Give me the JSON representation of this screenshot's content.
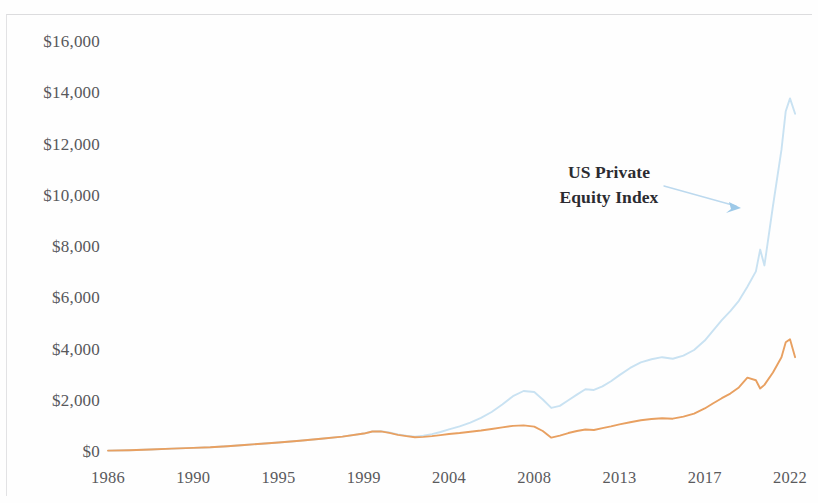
{
  "figure": {
    "width": 818,
    "height": 503,
    "background": "#fefefe"
  },
  "annotations": {
    "series_label_line1": "US Private",
    "series_label_line2": "Equity Index",
    "arrow_icon": "arrow-pointing-to-blue-line"
  },
  "colors": {
    "blue_line": "#c9e2f2",
    "orange_line": "#e8a061",
    "tick_text": "#58585b",
    "annotation_text": "#2b2b30",
    "arrow": "#bcd9ee"
  },
  "chart_data": {
    "type": "line",
    "title": "",
    "subtitle": "",
    "xlabel": "",
    "ylabel": "",
    "grid": false,
    "legend": "annotation-callout",
    "xlim": [
      1986,
      2022.5
    ],
    "ylim": [
      0,
      16800
    ],
    "ytick_values": [
      0,
      2000,
      4000,
      6000,
      8000,
      10000,
      12000,
      14000,
      16000
    ],
    "ytick_labels": [
      "$0",
      "$2,000",
      "$4,000",
      "$6,000",
      "$8,000",
      "$10,000",
      "$12,000",
      "$14,000",
      "$16,000"
    ],
    "xtick_values": [
      1986,
      1990,
      1995,
      1999,
      2004,
      2008,
      2013,
      2017,
      2022
    ],
    "xtick_labels": [
      "1986",
      "1990",
      "1995",
      "1999",
      "2004",
      "2008",
      "2013",
      "2017",
      "2022"
    ],
    "series": [
      {
        "name": "US Private Equity Index",
        "color": "#c9e2f2",
        "x": [
          1986,
          1987,
          1988,
          1989,
          1990,
          1991,
          1992,
          1993,
          1994,
          1995,
          1996,
          1997,
          1998,
          1999,
          1999.5,
          2000,
          2000.5,
          2001,
          2001.5,
          2002,
          2002.5,
          2003,
          2003.5,
          2004,
          2004.5,
          2005,
          2005.5,
          2006,
          2006.5,
          2007,
          2007.5,
          2008,
          2008.5,
          2009,
          2009.5,
          2010,
          2010.5,
          2011,
          2011.5,
          2012,
          2012.5,
          2013,
          2013.5,
          2014,
          2014.5,
          2015,
          2015.5,
          2016,
          2016.5,
          2017,
          2017.5,
          2018,
          2018.5,
          2019,
          2019.5,
          2020,
          2020.25,
          2020.5,
          2021,
          2021.5,
          2021.75,
          2022,
          2022.3
        ],
        "y": [
          55,
          70,
          95,
          130,
          160,
          185,
          225,
          275,
          320,
          370,
          440,
          520,
          600,
          720,
          800,
          810,
          760,
          690,
          640,
          600,
          640,
          700,
          780,
          880,
          1000,
          1150,
          1330,
          1560,
          1850,
          2180,
          2380,
          2340,
          2050,
          1720,
          1800,
          2020,
          2240,
          2450,
          2420,
          2560,
          2760,
          3000,
          3280,
          3500,
          3620,
          3700,
          3640,
          3760,
          3980,
          4350,
          4750,
          5150,
          5500,
          5900,
          6450,
          7050,
          7900,
          7280,
          9600,
          11800,
          13300,
          13800,
          13200
        ]
      },
      {
        "name": "Secondary index",
        "color": "#e8a061",
        "x": [
          1986,
          1987,
          1988,
          1989,
          1990,
          1991,
          1992,
          1993,
          1994,
          1995,
          1996,
          1997,
          1998,
          1999,
          1999.5,
          2000,
          2000.5,
          2001,
          2001.5,
          2002,
          2002.5,
          2003,
          2003.5,
          2004,
          2004.5,
          2005,
          2005.5,
          2006,
          2006.5,
          2007,
          2007.5,
          2008,
          2008.5,
          2009,
          2009.5,
          2010,
          2010.5,
          2011,
          2011.5,
          2012,
          2012.5,
          2013,
          2013.5,
          2014,
          2014.5,
          2015,
          2015.5,
          2016,
          2016.5,
          2017,
          2017.5,
          2018,
          2018.5,
          2019,
          2019.5,
          2020,
          2020.25,
          2020.5,
          2021,
          2021.5,
          2021.75,
          2022,
          2022.3
        ],
        "y": [
          55,
          70,
          95,
          130,
          160,
          185,
          225,
          275,
          320,
          370,
          440,
          520,
          600,
          720,
          800,
          805,
          745,
          670,
          620,
          575,
          590,
          620,
          660,
          700,
          740,
          790,
          840,
          900,
          960,
          1020,
          1040,
          990,
          820,
          560,
          640,
          740,
          820,
          880,
          860,
          930,
          1000,
          1080,
          1160,
          1240,
          1290,
          1320,
          1300,
          1380,
          1500,
          1700,
          1900,
          2100,
          2280,
          2520,
          2900,
          2800,
          2480,
          2620,
          3100,
          3700,
          4280,
          4400,
          3700
        ]
      }
    ],
    "annotation": {
      "text": "US Private Equity Index",
      "points_to_series": "US Private Equity Index"
    }
  }
}
